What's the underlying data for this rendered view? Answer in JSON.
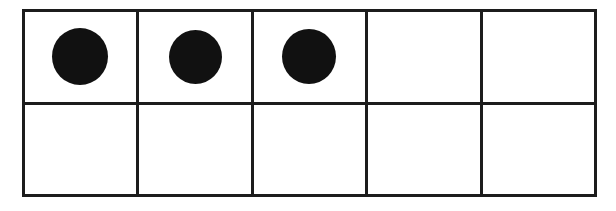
{
  "figure": {
    "name": "ten-frame",
    "rows": 2,
    "columns": 5,
    "total_cells": 10,
    "filled_count": 3,
    "empty_count": 7,
    "counter_shape": "circle",
    "counter_label": "counter-dot"
  },
  "colors": {
    "background": "#ffffff",
    "cell_fill": "#ffffff",
    "grid_line": "#1c1c1c",
    "counter_fill": "#111111"
  },
  "grid": {
    "cells": [
      {
        "row": 1,
        "column": 1,
        "filled": true,
        "value": 1
      },
      {
        "row": 1,
        "column": 2,
        "filled": true,
        "value": 1
      },
      {
        "row": 1,
        "column": 3,
        "filled": true,
        "value": 1
      },
      {
        "row": 1,
        "column": 4,
        "filled": false,
        "value": 0
      },
      {
        "row": 1,
        "column": 5,
        "filled": false,
        "value": 0
      },
      {
        "row": 2,
        "column": 1,
        "filled": false,
        "value": 0
      },
      {
        "row": 2,
        "column": 2,
        "filled": false,
        "value": 0
      },
      {
        "row": 2,
        "column": 3,
        "filled": false,
        "value": 0
      },
      {
        "row": 2,
        "column": 4,
        "filled": false,
        "value": 0
      },
      {
        "row": 2,
        "column": 5,
        "filled": false,
        "value": 0
      }
    ]
  }
}
